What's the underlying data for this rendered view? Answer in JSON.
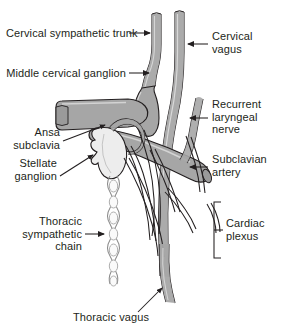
{
  "figure": {
    "background_color": "#ffffff",
    "line_color": "#231f20",
    "structure_fill": "#a6a6a6",
    "ganglion_fill": "#e6e6e6",
    "text_color": "#231f20"
  },
  "labels": {
    "cervical_sympathetic_trunk": "Cervical sympathetic trunk",
    "middle_cervical_ganglion": "Middle cervical ganglion",
    "ansa_subclavia": "Ansa\nsubclavia",
    "stellate_ganglion": "Stellate\nganglion",
    "thoracic_sympathetic_chain": "Thoracic\nsympathetic\nchain",
    "thoracic_vagus": "Thoracic vagus",
    "cervical_vagus": "Cervical\nvagus",
    "recurrent_laryngeal_nerve": "Recurrent\nlaryngeal\nnerve",
    "subclavian_artery": "Subclavian\nartery",
    "cardiac_plexus": "Cardiac\nplexus"
  },
  "structures": {
    "cervical_sympathetic_trunk": "cervical-sympathetic-trunk-shape",
    "middle_cervical_ganglion": "middle-cervical-ganglion-shape",
    "stellate_ganglion": "stellate-ganglion-shape",
    "subclavian_artery": "subclavian-artery-tube",
    "brachiocephalic_trunk": "brachiocephalic-trunk-tube",
    "cervical_vagus": "cervical-vagus-nerve",
    "recurrent_laryngeal_nerve": "recurrent-laryngeal-nerve",
    "thoracic_sympathetic_chain": "thoracic-sympathetic-chain",
    "thoracic_vagus": "thoracic-vagus-nerve",
    "cardiac_plexus_branches": "cardiac-plexus-branches",
    "ansa_subclavia": "ansa-subclavia-loop"
  }
}
